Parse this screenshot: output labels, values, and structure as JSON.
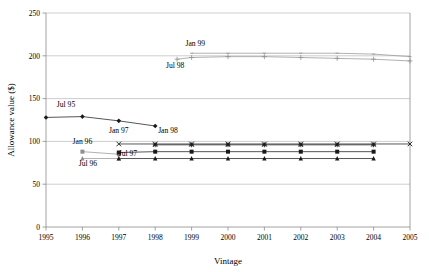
{
  "chart_data": {
    "type": "line",
    "title": "",
    "xlabel": "Vintage",
    "ylabel": "Allowance value ($)",
    "xlim": [
      1995,
      2005
    ],
    "ylim": [
      0,
      250
    ],
    "ytick_step": 50,
    "grid": true,
    "legend_position": "inline-annotations",
    "xticks": [
      "1995",
      "1996",
      "1997",
      "1998",
      "1999",
      "2000",
      "2001",
      "2002",
      "2003",
      "2004",
      "2005"
    ],
    "yticks": [
      "0",
      "50",
      "100",
      "150",
      "200",
      "250"
    ],
    "series": [
      {
        "name": "Jul 95",
        "marker": "filled-diamond",
        "tone": "dark",
        "label": "Jul 95",
        "label_x": 1995.55,
        "label_y": 140,
        "x": [
          1995,
          1996,
          1997,
          1998
        ],
        "values": [
          128,
          129,
          124,
          118
        ]
      },
      {
        "name": "Jan 96",
        "marker": "filled-square",
        "tone": "light",
        "label": "Jan 96",
        "label_x": 1996.0,
        "label_y": 97,
        "x": [
          1996,
          1997
        ],
        "values": [
          88,
          85
        ]
      },
      {
        "name": "Jul 96",
        "marker": "triangle",
        "tone": "light",
        "label": "Jul 96",
        "label_x": 1996.15,
        "label_y": 71,
        "x": [
          1996,
          1997
        ],
        "values": [
          80,
          80
        ]
      },
      {
        "name": "Jan 97",
        "marker": "cross-x",
        "tone": "dark",
        "label": "Jan 97",
        "label_x": 1997.0,
        "label_y": 110,
        "x": [
          1997,
          1998,
          1999,
          2000,
          2001,
          2002,
          2003,
          2004,
          2005
        ],
        "values": [
          97,
          97,
          97,
          97,
          97,
          97,
          97,
          97,
          97
        ]
      },
      {
        "name": "Jul 97",
        "marker": "filled-square",
        "tone": "dark",
        "label": "Jul 97",
        "label_x": 1997.25,
        "label_y": 83,
        "x": [
          1997,
          1998,
          1999,
          2000,
          2001,
          2002,
          2003,
          2004
        ],
        "values": [
          87,
          88,
          88,
          88,
          88,
          88,
          88,
          88
        ]
      },
      {
        "name": "Jan 98",
        "marker": "star",
        "tone": "dark",
        "label": "Jan 98",
        "label_x": 1998.35,
        "label_y": 110,
        "x": [
          1998,
          1999,
          2000,
          2001,
          2002,
          2003,
          2004
        ],
        "values": [
          96,
          96,
          96,
          96,
          96,
          96,
          96
        ]
      },
      {
        "name": "Jul 98",
        "marker": "plus",
        "tone": "light",
        "label": "Jul 98",
        "label_x": 1998.55,
        "label_y": 186,
        "x": [
          1998.6,
          1999,
          2000,
          2001,
          2002,
          2003,
          2004,
          2005
        ],
        "values": [
          196,
          198,
          199,
          199,
          198,
          197,
          196,
          194
        ]
      },
      {
        "name": "Jan 99",
        "marker": "small-dash",
        "tone": "light",
        "label": "Jan 99",
        "label_x": 1999.1,
        "label_y": 212,
        "x": [
          1999.0,
          2000,
          2001,
          2002,
          2003,
          2004,
          2005
        ],
        "values": [
          203,
          203,
          203,
          203,
          203,
          202,
          199
        ]
      },
      {
        "name": "lower-triangles",
        "marker": "triangle",
        "tone": "dark",
        "label": "",
        "label_x": 0,
        "label_y": 0,
        "x": [
          1997,
          1998,
          1999,
          2000,
          2001,
          2002,
          2003,
          2004
        ],
        "values": [
          80,
          80,
          80,
          80,
          80,
          80,
          80,
          80
        ]
      }
    ],
    "colors": {
      "axis": "#8a8a8a",
      "grid": "#b9b9b9",
      "dark_series": "#1a1a1a",
      "light_series": "#9d9d9d",
      "background": "#ffffff"
    }
  }
}
